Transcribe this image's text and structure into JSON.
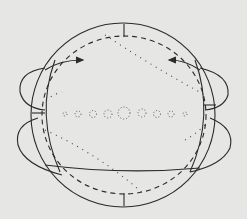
{
  "diagram": {
    "type": "sphere with field lines",
    "background": "#e6e6e4",
    "stroke": "#2a2a2a",
    "elements": {
      "outer_circle": "sphere outline",
      "dashed_ellipse": "equatorial dashed circle",
      "arrows": [
        "left arrow pointing right",
        "right arrow pointing left"
      ],
      "side_loops": [
        "upper-left loop",
        "lower-left loop",
        "upper-right loop",
        "lower-right loop"
      ],
      "dotted_lines": [
        "diagonal dotted line top",
        "diagonal dotted line bottom"
      ],
      "center_dots": "row of small dotted circles along equator"
    }
  }
}
